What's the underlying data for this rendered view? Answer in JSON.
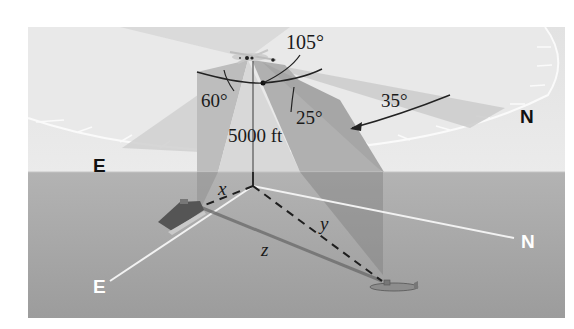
{
  "figure": {
    "type": "3d-bearing-diagram",
    "colors": {
      "sky_background": "#e6e6e6",
      "sea_top": "#a9a9a9",
      "sea_bottom": "#9b9b9b",
      "compass_disk": "#ececec",
      "compass_edge": "#f8f8f8",
      "wedge_light": "#cfcfcf",
      "wedge_mid": "#bdbdbd",
      "wedge_dark": "#a5a5a5",
      "line_dark": "#222222",
      "axis_white": "#f2f2f2",
      "label_dark": "#111111",
      "label_white": "#ffffff"
    },
    "angles": {
      "angle_105": "105°",
      "angle_60": "60°",
      "angle_25": "25°",
      "angle_35": "35°"
    },
    "altitude_label": "5000 ft",
    "variables": {
      "x": "x",
      "y": "y",
      "z": "z"
    },
    "compass_labels": {
      "east_upper": "E",
      "north_upper": "N"
    },
    "ground_axes": {
      "east_label": "E",
      "north_label": "N"
    },
    "objects": {
      "airplane": "airplane",
      "aircraft_carrier": "aircraft carrier",
      "submarine": "submarine"
    }
  }
}
